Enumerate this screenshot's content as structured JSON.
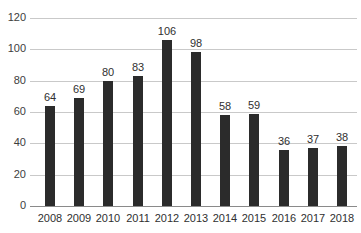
{
  "chart_data": {
    "type": "bar",
    "title": "",
    "subtitle": "",
    "xlabel": "",
    "ylabel": "",
    "categories": [
      "2008",
      "2009",
      "2010",
      "2011",
      "2012",
      "2013",
      "2014",
      "2015",
      "2016",
      "2017",
      "2018"
    ],
    "values": [
      64,
      69,
      80,
      83,
      106,
      98,
      58,
      59,
      36,
      37,
      38
    ],
    "value_labels": [
      "64",
      "69",
      "80",
      "83",
      "106",
      "98",
      "58",
      "59",
      "36",
      "37",
      "38"
    ],
    "ylim": [
      0,
      120
    ],
    "ytick_values": [
      0,
      20,
      40,
      60,
      80,
      100,
      120
    ],
    "ytick_labels": [
      "0",
      "20",
      "40",
      "60",
      "80",
      "100",
      "120"
    ],
    "grid": true,
    "grid_axis": "y",
    "legend": false,
    "legend_position": "none",
    "bar_color": "#2b2b2b",
    "gridline_color": "#c9c9c9",
    "axis_color": "#8a8a8a",
    "text_color": "#2f2f2f",
    "background_color": "#ffffff",
    "data_labels_shown": true,
    "data_label_position": "above-bar"
  },
  "artifacts": {
    "top_clipped_text": ""
  }
}
